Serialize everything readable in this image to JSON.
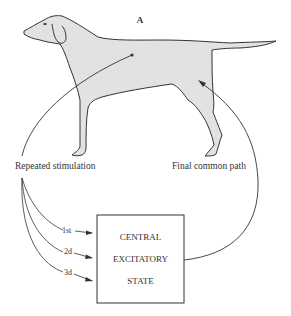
{
  "figure": {
    "panel_label": "A",
    "labels": {
      "left": "Repeated stimulation",
      "right": "Final common path"
    },
    "box": {
      "lines": [
        "CENTRAL",
        "EXCITATORY",
        "STATE"
      ]
    },
    "stimuli": [
      "1st",
      "2d",
      "3d"
    ],
    "colors": {
      "dog_fill": "#e2e2e2",
      "line": "#333333",
      "background": "#ffffff"
    }
  }
}
